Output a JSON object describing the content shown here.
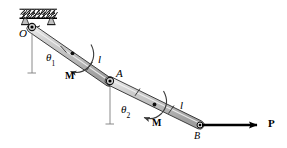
{
  "figure": {
    "width": 287,
    "height": 148,
    "background": "#ffffff",
    "line_color": "#000000",
    "link_fill": "#c9c9c9",
    "link_fill_light": "#d8d8d8"
  },
  "labels": {
    "pivot_O": "O",
    "joint_A": "A",
    "end_B": "B",
    "angle_1": "θ",
    "angle_1_sub": "1",
    "angle_2": "θ",
    "angle_2_sub": "2",
    "length_1": "l",
    "length_2": "l",
    "moment_1": "M",
    "moment_2": "M",
    "force_P": "P"
  },
  "geometry": {
    "support": {
      "hatch_x": 20,
      "hatch_y": 10,
      "hatch_width": 36,
      "hatch_height": 9,
      "note": "fixed ceiling with diagonal hatching"
    },
    "points": {
      "O": [
        32,
        27
      ],
      "A": [
        110,
        81
      ],
      "B": [
        200,
        125
      ]
    },
    "link_width": 7,
    "force_arrow": {
      "from": [
        202,
        125
      ],
      "to": [
        264,
        125
      ],
      "label_at": [
        270,
        119
      ]
    },
    "vertical_ref_1": {
      "from": [
        32,
        29
      ],
      "to": [
        32,
        72
      ]
    },
    "vertical_ref_2": {
      "from": [
        110,
        83
      ],
      "to": [
        110,
        124
      ]
    }
  },
  "icons": {
    "support_hatch": "fixed-support-hatching",
    "pin_joint": "pin-joint-icon",
    "curved_arrow": "curved-moment-arrow-icon",
    "force_arrow": "force-vector-arrow-icon",
    "center_dot": "center-of-mass-dot-icon"
  }
}
